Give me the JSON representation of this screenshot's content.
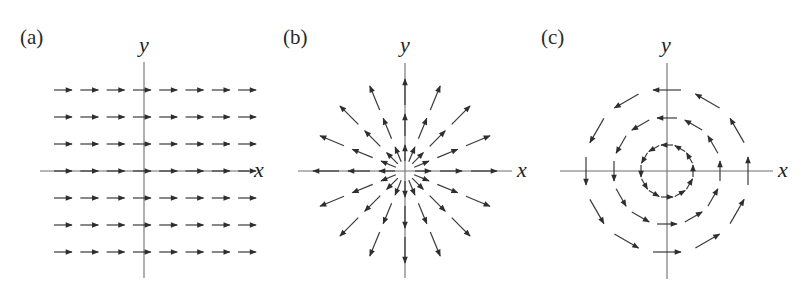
{
  "figure": {
    "colors": {
      "axis": "#6e6e6e",
      "arrow": "#3a3a3a",
      "text": "#222222",
      "background": "#ffffff"
    },
    "panels": [
      {
        "id": "a",
        "label": "(a)",
        "field_type": "uniform",
        "field_description": "Uniform field pointing in +x direction",
        "x_axis_label": "x",
        "y_axis_label": "y",
        "grid": {
          "columns": 8,
          "rows": 7
        },
        "arrow_direction": "+x"
      },
      {
        "id": "b",
        "label": "(b)",
        "field_type": "radial",
        "field_description": "Radially outward (source) field, magnitude increasing with distance",
        "x_axis_label": "x",
        "y_axis_label": "y",
        "rays": 16,
        "arrows_per_ray": 3
      },
      {
        "id": "c",
        "label": "(c)",
        "field_type": "rotational",
        "field_description": "Counterclockwise circulating field, magnitude increasing with radius",
        "x_axis_label": "x",
        "y_axis_label": "y",
        "rings": 3,
        "arrows_per_ring": 12,
        "rotation": "counterclockwise"
      }
    ]
  }
}
